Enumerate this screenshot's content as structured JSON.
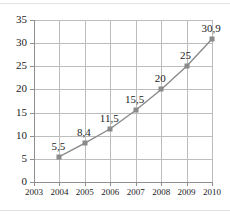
{
  "chart_data": {
    "type": "line",
    "title": "",
    "xlabel": "",
    "ylabel": "",
    "categories": [
      "2003",
      "2004",
      "2005",
      "2006",
      "2007",
      "2008",
      "2009",
      "2010"
    ],
    "x": [
      2003,
      2004,
      2005,
      2006,
      2007,
      2008,
      2009,
      2010
    ],
    "xlim": [
      2003,
      2010
    ],
    "ylim": [
      0,
      35
    ],
    "y_ticks": [
      0,
      5,
      10,
      15,
      20,
      25,
      30,
      35
    ],
    "y_tick_labels": [
      "0",
      "5",
      "10",
      "15",
      "20",
      "25",
      "30",
      "35"
    ],
    "x_tick_labels": [
      "2003",
      "2004",
      "2005",
      "2006",
      "2007",
      "2008",
      "2009",
      "2010"
    ],
    "grid": true,
    "legend": null,
    "legend_position": "none",
    "decimal_separator": ",",
    "marker": "square",
    "series": [
      {
        "name": "",
        "points": [
          {
            "x": 2004,
            "y": 5.5,
            "label": "5,5"
          },
          {
            "x": 2005,
            "y": 8.4,
            "label": "8,4"
          },
          {
            "x": 2006,
            "y": 11.5,
            "label": "11,5"
          },
          {
            "x": 2007,
            "y": 15.5,
            "label": "15,5"
          },
          {
            "x": 2008,
            "y": 20,
            "label": "20"
          },
          {
            "x": 2009,
            "y": 25,
            "label": "25"
          },
          {
            "x": 2010,
            "y": 30.9,
            "label": "30,9"
          }
        ]
      }
    ]
  },
  "colors": {
    "series_line": "#8a8a8a",
    "marker": "#8a8a8a",
    "gridline": "#bdbdbd",
    "axis": "#8f8f8f",
    "text": "#1c1c1c",
    "background": "#ffffff",
    "frame_rule": "#e2e2e2"
  }
}
